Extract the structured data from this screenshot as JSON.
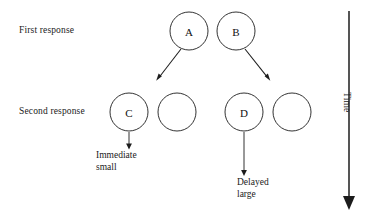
{
  "diagram": {
    "row_labels": {
      "first_response": "First response",
      "second_response": "Second response"
    },
    "axis": {
      "time_label": "Time",
      "direction": "downward"
    },
    "nodes": [
      {
        "id": "A",
        "label": "A",
        "row": "first response",
        "cx": 189,
        "cy": 31,
        "r": 19
      },
      {
        "id": "B",
        "label": "B",
        "row": "first response",
        "cx": 236,
        "cy": 31,
        "r": 19
      },
      {
        "id": "C",
        "label": "C",
        "row": "second response",
        "cx": 129,
        "cy": 112,
        "r": 19
      },
      {
        "id": "C2",
        "label": "",
        "row": "second response",
        "cx": 177,
        "cy": 112,
        "r": 19
      },
      {
        "id": "D",
        "label": "D",
        "row": "second response",
        "cx": 244,
        "cy": 112,
        "r": 19
      },
      {
        "id": "D2",
        "label": "",
        "row": "second response",
        "cx": 292,
        "cy": 112,
        "r": 19
      }
    ],
    "branches": [
      {
        "from": "A",
        "to": "C2",
        "x1": 181,
        "y1": 49,
        "x2": 158,
        "y2": 79
      },
      {
        "from": "B",
        "to": "D2",
        "x1": 245,
        "y1": 49,
        "x2": 269,
        "y2": 79
      }
    ],
    "outcomes": [
      {
        "from": "C",
        "text": "Immediate\nsmall",
        "x": 129,
        "y1": 132,
        "y2": 147
      },
      {
        "from": "D",
        "text": "Delayed\nlarge",
        "x": 244,
        "y1": 132,
        "y2": 174
      }
    ],
    "colors": {
      "stroke": "#1c1c1c",
      "text": "#1a1a1a",
      "background": "#ffffff"
    }
  }
}
